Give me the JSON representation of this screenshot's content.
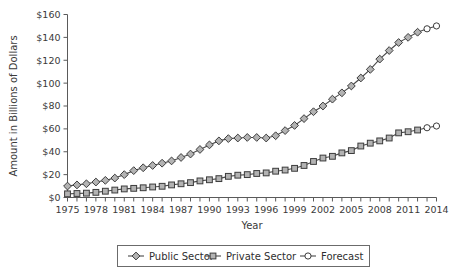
{
  "chart_data": {
    "type": "line",
    "title": "",
    "xlabel": "Year",
    "ylabel": "Amount in Billions of Dollars",
    "ylim": [
      0,
      160
    ],
    "ytick_values": [
      0,
      20,
      40,
      60,
      80,
      100,
      120,
      140,
      160
    ],
    "ytick_labels": [
      "$0",
      "$20",
      "$40",
      "$60",
      "$80",
      "$100",
      "$120",
      "$140",
      "$160"
    ],
    "xlim": [
      1975,
      2014
    ],
    "x": [
      1975,
      1976,
      1977,
      1978,
      1979,
      1980,
      1981,
      1982,
      1983,
      1984,
      1985,
      1986,
      1987,
      1988,
      1989,
      1990,
      1991,
      1992,
      1993,
      1994,
      1995,
      1996,
      1997,
      1998,
      1999,
      2000,
      2001,
      2002,
      2003,
      2004,
      2005,
      2006,
      2007,
      2008,
      2009,
      2010,
      2011,
      2012,
      2013,
      2014
    ],
    "xtick_all": [
      1975,
      1976,
      1977,
      1978,
      1979,
      1980,
      1981,
      1982,
      1983,
      1984,
      1985,
      1986,
      1987,
      1988,
      1989,
      1990,
      1991,
      1992,
      1993,
      1994,
      1995,
      1996,
      1997,
      1998,
      1999,
      2000,
      2001,
      2002,
      2003,
      2004,
      2005,
      2006,
      2007,
      2008,
      2009,
      2010,
      2011,
      2012,
      2013,
      2014
    ],
    "xtick_labeled": [
      "1975",
      "1978",
      "1981",
      "1984",
      "1987",
      "1990",
      "1993",
      "1996",
      "1999",
      "2002",
      "2005",
      "2008",
      "2011",
      "2014"
    ],
    "grid": false,
    "legend_position": "bottom",
    "forecast_start_year": 2013,
    "series": [
      {
        "name": "Public Sector",
        "marker": "diamond",
        "values": [
          10,
          11,
          12,
          13.5,
          15,
          17,
          20,
          23.5,
          26,
          28,
          30,
          32,
          35,
          38,
          42,
          46,
          49.5,
          51.5,
          52,
          52.5,
          52.5,
          52,
          54,
          58.5,
          63,
          69,
          75,
          80,
          86,
          91.5,
          97.5,
          104.5,
          112,
          121,
          128.5,
          135.5,
          140,
          144.5,
          147.5,
          150
        ]
      },
      {
        "name": "Private Sector",
        "marker": "square",
        "values": [
          3.2,
          3.5,
          3.8,
          4.5,
          5.5,
          6.5,
          7.5,
          8,
          8.5,
          9.2,
          9.8,
          11,
          12,
          13,
          14.5,
          15.5,
          16.5,
          18.5,
          19.5,
          20,
          21,
          21.5,
          23,
          24,
          25.5,
          28,
          31.5,
          34.5,
          36,
          39,
          41,
          45,
          47.5,
          49.5,
          52,
          56.5,
          57.5,
          59,
          61,
          62.5
        ]
      }
    ],
    "legend": [
      {
        "label": "Public Sector",
        "marker": "diamond"
      },
      {
        "label": "Private Sector",
        "marker": "square"
      },
      {
        "label": "Forecast",
        "marker": "circle"
      }
    ],
    "colors": {
      "line": "#4a4a4a",
      "marker_fill": "#b3b3b3",
      "marker_stroke": "#3c3c3c",
      "forecast_fill": "#ffffff",
      "axis": "#5a5a5a",
      "text": "#3a3a3a"
    }
  }
}
